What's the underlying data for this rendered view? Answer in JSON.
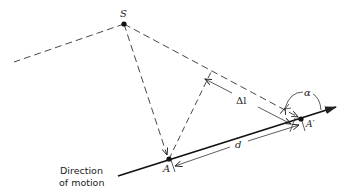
{
  "diagram": {
    "labels": {
      "source": "S",
      "point_a": "A",
      "point_a_prime": "A′",
      "path_difference": "Δl",
      "distance": "d",
      "angle": "α",
      "direction_line1": "Direction",
      "direction_line2": "of motion"
    },
    "colors": {
      "stroke": "#222222",
      "background": "#ffffff"
    }
  }
}
